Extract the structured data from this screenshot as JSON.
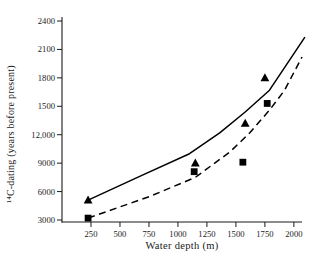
{
  "chart_data": {
    "type": "line",
    "title": "",
    "xlabel": "Water depth (m)",
    "ylabel": "¹⁴C-dating (years before present)",
    "xlim": [
      0,
      2070
    ],
    "ylim": [
      3000,
      24300
    ],
    "grid": false,
    "legend": "none",
    "x_ticks": [
      {
        "value": 250,
        "label": "250"
      },
      {
        "value": 500,
        "label": "500"
      },
      {
        "value": 750,
        "label": "750"
      },
      {
        "value": 1000,
        "label": "1000"
      },
      {
        "value": 1250,
        "label": "1250"
      },
      {
        "value": 1500,
        "label": "1500"
      },
      {
        "value": 1750,
        "label": "1750"
      },
      {
        "value": 2000,
        "label": "2000"
      }
    ],
    "y_ticks": [
      {
        "value": 3000,
        "label": "3000"
      },
      {
        "value": 6000,
        "label": "6000"
      },
      {
        "value": 9000,
        "label": "9000"
      },
      {
        "value": 12000,
        "label": "12,000"
      },
      {
        "value": 15000,
        "label": "1500"
      },
      {
        "value": 18000,
        "label": "1800"
      },
      {
        "value": 21000,
        "label": "2100"
      },
      {
        "value": 24000,
        "label": "2400"
      }
    ],
    "series": [
      {
        "name": "solid line with triangle markers",
        "marker": "triangle",
        "line_style": "solid",
        "color": "#000000",
        "line_points": [
          [
            225,
            5100
          ],
          [
            670,
            7600
          ],
          [
            1100,
            10000
          ],
          [
            1360,
            12200
          ],
          [
            1580,
            14400
          ],
          [
            1790,
            16700
          ],
          [
            2095,
            22300
          ]
        ],
        "points": [
          [
            225,
            5100
          ],
          [
            1150,
            9000
          ],
          [
            1580,
            13200
          ],
          [
            1750,
            18000
          ]
        ]
      },
      {
        "name": "dashed line with square markers",
        "marker": "square",
        "line_style": "dashed",
        "color": "#000000",
        "line_points": [
          [
            225,
            3200
          ],
          [
            760,
            5500
          ],
          [
            1150,
            7500
          ],
          [
            1450,
            10200
          ],
          [
            1620,
            12200
          ],
          [
            1790,
            14600
          ],
          [
            1920,
            16700
          ],
          [
            2070,
            20200
          ]
        ],
        "points": [
          [
            225,
            3200
          ],
          [
            1140,
            8100
          ],
          [
            1560,
            9100
          ],
          [
            1770,
            15300
          ]
        ]
      }
    ]
  }
}
